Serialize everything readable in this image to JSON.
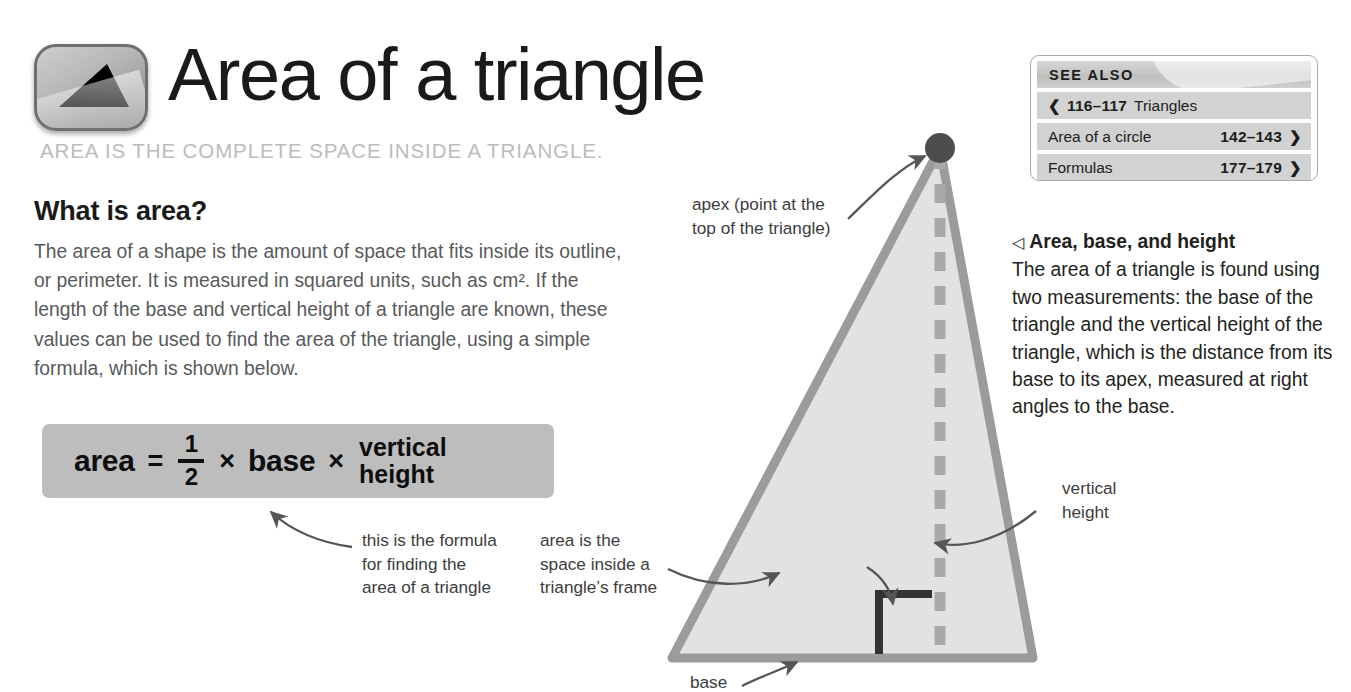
{
  "header": {
    "title": "Area of a triangle",
    "subtitle": "AREA IS THE COMPLETE SPACE INSIDE A TRIANGLE.",
    "logo_icon": "triangle-icon"
  },
  "see_also": {
    "header_label": "SEE ALSO",
    "rows": [
      {
        "direction": "prev",
        "chevron": "❮",
        "pages": "116–117",
        "label": "Triangles"
      },
      {
        "direction": "next",
        "chevron": "❯",
        "pages": "142–143",
        "label": "Area of a circle"
      },
      {
        "direction": "next",
        "chevron": "❯",
        "pages": "177–179",
        "label": "Formulas"
      }
    ]
  },
  "main": {
    "section_heading": "What is area?",
    "body_paragraph": "The area of a shape is the amount of space that fits inside its outline, or perimeter. It is measured in squared units, such as cm². If the length of the base and vertical height of a triangle are known, these values can be used to find the area of the triangle, using a simple formula, which is shown below."
  },
  "formula": {
    "lhs": "area",
    "equals": "=",
    "fraction_numerator": "1",
    "fraction_denominator": "2",
    "times_1": "×",
    "base": "base",
    "times_2": "×",
    "height_line1": "vertical",
    "height_line2": "height"
  },
  "captions": {
    "formula": "this is the formula\nfor finding the\narea of a triangle",
    "area": "area is the\nspace inside a\ntriangle’s frame",
    "apex": "apex (point at the\ntop of the triangle)",
    "right_angle": "vertical height is\nat right angles\nto the base",
    "vertical_height": "vertical\nheight",
    "base": "base"
  },
  "right_caption": {
    "marker": "◁",
    "heading": "Area, base, and height",
    "body": "The area of a triangle is found using two measurements: the base of the triangle and the vertical height of the triangle, which is the distance from its base to its apex, measured at right angles to the base."
  },
  "colors": {
    "triangle_fill": "#e2e2e2",
    "triangle_stroke": "#9b9b9b",
    "dashed_line": "#a9a9a9",
    "apex_dot": "#4d4d4d",
    "right_angle_marker": "#333333",
    "arrow": "#555555",
    "formula_box": "#bdbdbd",
    "see_also_row": "#d2d2d2",
    "subtitle": "#bcbcbc",
    "body_text": "#58595b"
  },
  "diagram": {
    "apex_label": "apex",
    "base_label": "base",
    "vertical_height_label": "vertical height",
    "right_angle_label": "right-angle-marker"
  }
}
